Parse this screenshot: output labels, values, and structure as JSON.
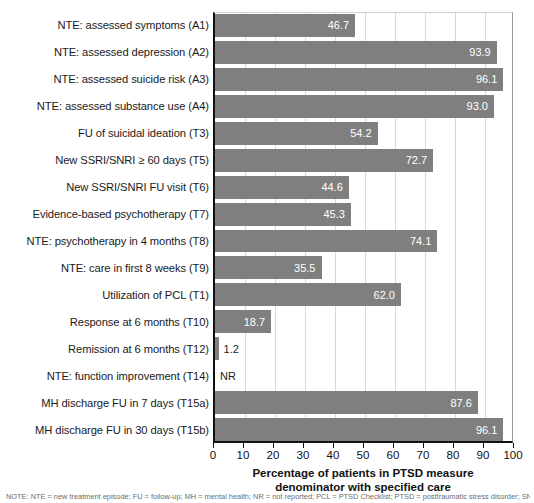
{
  "chart_data": {
    "type": "bar",
    "orientation": "horizontal",
    "title": "",
    "xlabel": "Percentage of patients in PTSD measure denominator with specified care",
    "xlabel_line1": "Percentage of patients in PTSD measure",
    "xlabel_line2": "denominator with specified care",
    "ylabel": "",
    "xlim": [
      0,
      100
    ],
    "xticks": [
      0,
      10,
      20,
      30,
      40,
      50,
      60,
      70,
      80,
      90,
      100
    ],
    "grid": true,
    "grid_axis": "x",
    "legend": "none",
    "bar_color": "#7f7f7f",
    "categories": [
      "NTE: assessed symptoms (A1)",
      "NTE: assessed depression (A2)",
      "NTE: assessed suicide risk (A3)",
      "NTE: assessed substance use (A4)",
      "FU of suicidal ideation (T3)",
      "New SSRI/SNRI ≥ 60 days (T5)",
      "New SSRI/SNRI FU visit (T6)",
      "Evidence-based psychotherapy (T7)",
      "NTE: psychotherapy in 4 months (T8)",
      "NTE: care in first 8 weeks (T9)",
      "Utilization of PCL (T1)",
      "Response at 6 months (T10)",
      "Remission at 6 months (T12)",
      "NTE: function improvement (T14)",
      "MH discharge FU in 7 days (T15a)",
      "MH discharge FU in 30 days (T15b)"
    ],
    "values": [
      46.7,
      93.9,
      96.1,
      93.0,
      54.2,
      72.7,
      44.6,
      45.3,
      74.1,
      35.5,
      62.0,
      18.7,
      1.2,
      null,
      87.6,
      96.1
    ],
    "value_labels": [
      "46.7",
      "93.9",
      "96.1",
      "93.0",
      "54.2",
      "72.7",
      "44.6",
      "45.3",
      "74.1",
      "35.5",
      "62.0",
      "18.7",
      "1.2",
      "NR",
      "87.6",
      "96.1"
    ]
  },
  "footnote": "NOTE: NTE = new treatment episode; FU = follow-up; MH = mental health; NR = not reported; PCL = PTSD Checklist; PTSD = posttraumatic stress disorder; SNRI = serotonin-norepinephrine reuptake inhibitor; SSRI = selective serotonin reuptake inhibitor."
}
